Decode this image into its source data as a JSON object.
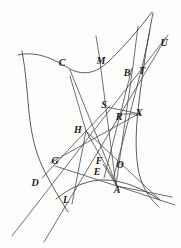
{
  "figure": {
    "width": 181,
    "height": 248,
    "background_color": "#fdfdfb",
    "ink_color": "#4a4a48",
    "label_color": "#1c1c1c",
    "labels": [
      {
        "text": "C",
        "x": 62,
        "y": 63
      },
      {
        "text": "M",
        "x": 101,
        "y": 61
      },
      {
        "text": "B",
        "x": 127,
        "y": 73
      },
      {
        "text": "T",
        "x": 142,
        "y": 71
      },
      {
        "text": "U",
        "x": 164,
        "y": 43
      },
      {
        "text": "S",
        "x": 104,
        "y": 105
      },
      {
        "text": "R",
        "x": 119,
        "y": 117
      },
      {
        "text": "X",
        "x": 139,
        "y": 113
      },
      {
        "text": "H",
        "x": 78,
        "y": 130
      },
      {
        "text": "G",
        "x": 55,
        "y": 161
      },
      {
        "text": "F",
        "x": 99,
        "y": 161
      },
      {
        "text": "E",
        "x": 97,
        "y": 172
      },
      {
        "text": "O",
        "x": 120,
        "y": 165
      },
      {
        "text": "D",
        "x": 35,
        "y": 183
      },
      {
        "text": "L",
        "x": 66,
        "y": 200
      },
      {
        "text": "A",
        "x": 117,
        "y": 190
      }
    ],
    "curves": [
      {
        "name": "upper-branch",
        "d": "M 18,55 C 40,50 58,62 70,69 C 84,76 96,73 108,62 C 124,47 140,28 152,12"
      },
      {
        "name": "left-branch",
        "d": "M 22,51 C 26,72 27,92 29,112 C 31,134 36,155 45,172 C 52,186 60,199 68,212"
      },
      {
        "name": "lower-branch",
        "d": "M 56,199 C 72,186 90,179 107,180 C 124,181 142,188 160,200"
      },
      {
        "name": "right-branch",
        "d": "M 153,13 C 148,38 144,62 141,86 C 137,115 134,144 138,168 C 141,185 148,197 158,206"
      }
    ],
    "lines": [
      {
        "name": "line-D-U",
        "d": "M 12,236 L 168,35"
      },
      {
        "name": "line-L-U",
        "d": "M 44,242 L 166,38"
      },
      {
        "name": "line-A-M",
        "d": "M 116,186 L 99,54 L 96,36"
      },
      {
        "name": "line-A-B-top",
        "d": "M 116,185 L 133,66 L 138,26"
      },
      {
        "name": "line-O-T",
        "d": "M 114,176 L 143,63 L 150,30"
      },
      {
        "name": "line-E-B",
        "d": "M 104,178 L 132,68"
      },
      {
        "name": "line-H-A",
        "d": "M 70,76 L 86,131 L 117,185"
      },
      {
        "name": "line-C-A",
        "d": "M 70,70 L 117,186"
      },
      {
        "name": "line-G-X",
        "d": "M 50,163 L 140,113"
      },
      {
        "name": "line-H-X-ray",
        "d": "M 86,131 L 160,200"
      },
      {
        "name": "line-S-X",
        "d": "M 107,107 L 140,114"
      },
      {
        "name": "line-R-X",
        "d": "M 118,114 L 141,114"
      },
      {
        "name": "line-D-H-S",
        "d": "M 42,178 L 86,131 L 110,106"
      },
      {
        "name": "line-G-A-right",
        "d": "M 55,166 L 117,186 L 172,197"
      },
      {
        "name": "line-A-east",
        "d": "M 117,186 L 175,205"
      },
      {
        "name": "line-F-A",
        "d": "M 103,164 L 117,186"
      },
      {
        "name": "line-L-H",
        "d": "M 72,204 L 86,131"
      }
    ]
  }
}
